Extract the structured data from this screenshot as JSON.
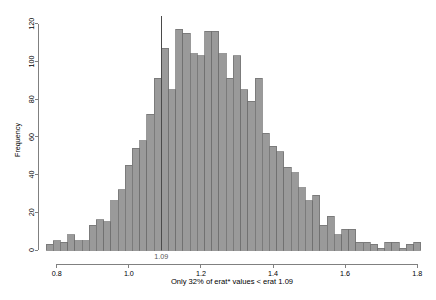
{
  "chart_data": {
    "type": "bar",
    "subtype": "histogram",
    "title": "",
    "xlabel": "Only 32% of erat* values < erat 1.09",
    "ylabel": "Frequency",
    "xlim": [
      0.77,
      1.83
    ],
    "ylim": [
      0,
      122
    ],
    "grid": false,
    "legend": null,
    "bar_color": "#9a9a9a",
    "bar_edge_color": "#6e6e6e",
    "axis_color": "#808080",
    "bin_width": 0.02,
    "xticks": [
      0.8,
      1.0,
      1.2,
      1.4,
      1.6,
      1.8
    ],
    "xtick_labels": [
      "0.8",
      "1.0",
      "1.2",
      "1.4",
      "1.6",
      "1.8"
    ],
    "yticks": [
      0,
      20,
      40,
      60,
      80,
      100,
      120
    ],
    "ytick_labels": [
      "0",
      "20",
      "40",
      "60",
      "80",
      "100",
      "120"
    ],
    "annotations": [
      {
        "name": "reference-line-1.09",
        "type": "vline",
        "x": 1.09,
        "label": "1.09",
        "color": "#4a4a4a"
      }
    ],
    "bins": [
      {
        "x": 0.78,
        "value": 3
      },
      {
        "x": 0.8,
        "value": 5
      },
      {
        "x": 0.82,
        "value": 4
      },
      {
        "x": 0.84,
        "value": 8
      },
      {
        "x": 0.86,
        "value": 5
      },
      {
        "x": 0.88,
        "value": 5
      },
      {
        "x": 0.9,
        "value": 13
      },
      {
        "x": 0.92,
        "value": 16
      },
      {
        "x": 0.94,
        "value": 15
      },
      {
        "x": 0.96,
        "value": 26
      },
      {
        "x": 0.98,
        "value": 32
      },
      {
        "x": 1.0,
        "value": 45
      },
      {
        "x": 1.02,
        "value": 54
      },
      {
        "x": 1.04,
        "value": 58
      },
      {
        "x": 1.06,
        "value": 72
      },
      {
        "x": 1.08,
        "value": 91
      },
      {
        "x": 1.1,
        "value": 107
      },
      {
        "x": 1.12,
        "value": 85
      },
      {
        "x": 1.14,
        "value": 117
      },
      {
        "x": 1.16,
        "value": 115
      },
      {
        "x": 1.18,
        "value": 104
      },
      {
        "x": 1.2,
        "value": 103
      },
      {
        "x": 1.22,
        "value": 116
      },
      {
        "x": 1.24,
        "value": 116
      },
      {
        "x": 1.26,
        "value": 104
      },
      {
        "x": 1.28,
        "value": 91
      },
      {
        "x": 1.3,
        "value": 103
      },
      {
        "x": 1.32,
        "value": 85
      },
      {
        "x": 1.34,
        "value": 79
      },
      {
        "x": 1.36,
        "value": 91
      },
      {
        "x": 1.38,
        "value": 62
      },
      {
        "x": 1.4,
        "value": 55
      },
      {
        "x": 1.42,
        "value": 52
      },
      {
        "x": 1.44,
        "value": 44
      },
      {
        "x": 1.46,
        "value": 41
      },
      {
        "x": 1.48,
        "value": 33
      },
      {
        "x": 1.5,
        "value": 26
      },
      {
        "x": 1.52,
        "value": 29
      },
      {
        "x": 1.54,
        "value": 13
      },
      {
        "x": 1.56,
        "value": 18
      },
      {
        "x": 1.58,
        "value": 8
      },
      {
        "x": 1.6,
        "value": 11
      },
      {
        "x": 1.62,
        "value": 11
      },
      {
        "x": 1.64,
        "value": 4
      },
      {
        "x": 1.66,
        "value": 4
      },
      {
        "x": 1.68,
        "value": 3
      },
      {
        "x": 1.7,
        "value": 1
      },
      {
        "x": 1.72,
        "value": 4
      },
      {
        "x": 1.74,
        "value": 4
      },
      {
        "x": 1.76,
        "value": 1
      },
      {
        "x": 1.78,
        "value": 3
      },
      {
        "x": 1.8,
        "value": 4
      }
    ]
  }
}
